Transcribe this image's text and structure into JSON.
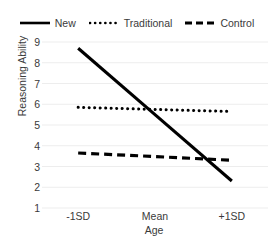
{
  "chart_data": {
    "type": "line",
    "title": "",
    "xlabel": "Age",
    "ylabel": "Reasoning Ability",
    "categories": [
      "-1SD",
      "Mean",
      "+1SD"
    ],
    "ylim": [
      1,
      9
    ],
    "yticks": [
      9,
      8,
      7,
      6,
      5,
      4,
      3,
      2,
      1
    ],
    "grid": "horizontal",
    "legend_position": "top",
    "series": [
      {
        "name": "New",
        "style": "solid",
        "color": "#000000",
        "values": [
          8.7,
          5.5,
          2.3
        ]
      },
      {
        "name": "Traditional",
        "style": "dotted",
        "color": "#000000",
        "values": [
          5.85,
          5.75,
          5.65
        ]
      },
      {
        "name": "Control",
        "style": "dashed",
        "color": "#000000",
        "values": [
          3.65,
          3.48,
          3.3
        ]
      }
    ]
  },
  "legend": {
    "items": [
      {
        "label": "New",
        "swatch": "solid-line-swatch"
      },
      {
        "label": "Traditional",
        "swatch": "dotted-line-swatch"
      },
      {
        "label": "Control",
        "swatch": "dashed-line-swatch"
      }
    ]
  },
  "axes": {
    "y_title": "Reasoning Ability",
    "x_title": "Age",
    "y_tick_labels": [
      "9",
      "8",
      "7",
      "6",
      "5",
      "4",
      "3",
      "2",
      "1"
    ],
    "x_tick_labels": [
      "-1SD",
      "Mean",
      "+1SD"
    ]
  },
  "colors": {
    "line": "#000000",
    "gridline": "#ededed",
    "text": "#3a3a3a",
    "background": "#ffffff"
  }
}
